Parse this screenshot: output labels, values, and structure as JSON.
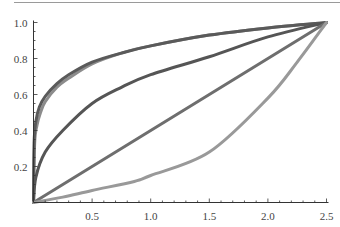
{
  "chart_data": {
    "type": "line",
    "title": "",
    "xlabel": "",
    "ylabel": "",
    "xlim": [
      0,
      2.5
    ],
    "ylim": [
      0,
      1.0
    ],
    "grid": false,
    "legend": null,
    "x_ticks": [
      {
        "value": 0.5,
        "label": "0.5"
      },
      {
        "value": 1.0,
        "label": "1.0"
      },
      {
        "value": 1.5,
        "label": "1.5"
      },
      {
        "value": 2.0,
        "label": "2.0"
      },
      {
        "value": 2.5,
        "label": "2.5"
      }
    ],
    "y_ticks": [
      {
        "value": 0.2,
        "label": "0.2"
      },
      {
        "value": 0.4,
        "label": "0.4"
      },
      {
        "value": 0.6,
        "label": "0.6"
      },
      {
        "value": 0.8,
        "label": "0.8"
      },
      {
        "value": 1.0,
        "label": "1.0"
      }
    ],
    "x_minor_step": 0.1,
    "y_minor_step": 0.05,
    "series": [
      {
        "name": "curve-top-light",
        "color": "#8c8c8c",
        "x": [
          0,
          0.01,
          0.03,
          0.06,
          0.1,
          0.2,
          0.3,
          0.5,
          0.75,
          1.0,
          1.5,
          2.0,
          2.5
        ],
        "y": [
          0,
          0.33,
          0.43,
          0.5,
          0.56,
          0.64,
          0.69,
          0.77,
          0.83,
          0.87,
          0.93,
          0.97,
          1.0
        ]
      },
      {
        "name": "curve-top-dark",
        "color": "#5a5a5a",
        "x": [
          0,
          0.005,
          0.02,
          0.05,
          0.1,
          0.2,
          0.3,
          0.5,
          0.75,
          1.0,
          1.5,
          2.0,
          2.5
        ],
        "y": [
          0,
          0.33,
          0.45,
          0.53,
          0.59,
          0.66,
          0.71,
          0.78,
          0.83,
          0.87,
          0.93,
          0.97,
          1.0
        ]
      },
      {
        "name": "curve-middle-dark",
        "color": "#555555",
        "x": [
          0,
          0.02,
          0.1,
          0.25,
          0.5,
          0.75,
          1.0,
          1.5,
          2.0,
          2.5
        ],
        "y": [
          0,
          0.14,
          0.28,
          0.4,
          0.55,
          0.64,
          0.71,
          0.81,
          0.92,
          1.0
        ]
      },
      {
        "name": "line-linear",
        "color": "#6e6e6e",
        "x": [
          0,
          2.5
        ],
        "y": [
          0,
          1.0
        ]
      },
      {
        "name": "curve-bottom-light",
        "color": "#999999",
        "x": [
          0,
          0.25,
          0.5,
          0.86,
          1.0,
          1.5,
          2.0,
          2.25,
          2.5
        ],
        "y": [
          0,
          0.03,
          0.067,
          0.117,
          0.15,
          0.28,
          0.58,
          0.78,
          1.0
        ]
      }
    ]
  }
}
